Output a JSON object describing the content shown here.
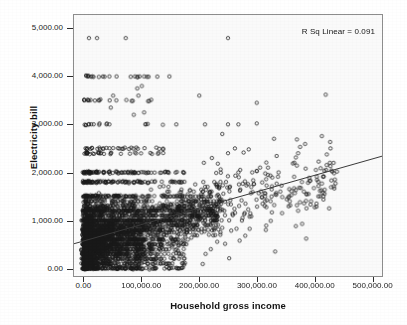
{
  "chart_data": {
    "type": "scatter",
    "title": "",
    "xlabel": "Household gross income",
    "ylabel": "Electricity bill",
    "xlim": [
      -18000,
      518000
    ],
    "ylim": [
      -160,
      5280
    ],
    "grid": false,
    "legend": null,
    "annotations": [
      {
        "name": "r-squared",
        "text": "R Sq Linear = 0.091",
        "position": "top-right"
      }
    ],
    "xticks": [
      {
        "value": 0,
        "label": "0.00"
      },
      {
        "value": 100000,
        "label": "100,000.00"
      },
      {
        "value": 200000,
        "label": "200,000.00"
      },
      {
        "value": 300000,
        "label": "300,000.00"
      },
      {
        "value": 400000,
        "label": "400,000.00"
      },
      {
        "value": 500000,
        "label": "500,000.00"
      }
    ],
    "yticks": [
      {
        "value": 0,
        "label": "0.00"
      },
      {
        "value": 1000,
        "label": "1,000.00"
      },
      {
        "value": 2000,
        "label": "2,000.00"
      },
      {
        "value": 3000,
        "label": "3,000.00"
      },
      {
        "value": 4000,
        "label": "4,000.00"
      },
      {
        "value": 5000,
        "label": "5,000.00"
      }
    ],
    "marker": {
      "shape": "open-circle",
      "size_px": 3.4,
      "edge_color": "#1a1a1a",
      "fill_color": "none"
    },
    "fit_line": {
      "name": "linear-regression-line",
      "color": "#3a3a3a",
      "width_px": 1,
      "r_squared": 0.091,
      "intercept": 610,
      "slope": 0.0034,
      "endpoints": [
        {
          "x": -18000,
          "y": 549
        },
        {
          "x": 518000,
          "y": 2371
        }
      ]
    },
    "series": [
      {
        "name": "households",
        "n_points_drawn": 2400,
        "description": "Dense cloud concentrated below 150,000 income and below 2,000 bill, with horizontal banding at round bill values (0, 500, 1000, 1200, 1500, 1800, 2000, 2400, 2500, 3000, 3500, 4000) and a long sparse right tail out to 430,000 income.",
        "notable_points": [
          {
            "x": 8000,
            "y": 4800
          },
          {
            "x": 22000,
            "y": 4800
          },
          {
            "x": 72000,
            "y": 4800
          },
          {
            "x": 250000,
            "y": 4800
          },
          {
            "x": 6000,
            "y": 4000
          },
          {
            "x": 14000,
            "y": 4000
          },
          {
            "x": 56000,
            "y": 4000
          },
          {
            "x": 88000,
            "y": 4000
          },
          {
            "x": 96000,
            "y": 4000
          },
          {
            "x": 104000,
            "y": 4000
          },
          {
            "x": 148000,
            "y": 4000
          },
          {
            "x": 100000,
            "y": 3800
          },
          {
            "x": 92000,
            "y": 3750
          },
          {
            "x": 50000,
            "y": 3600
          },
          {
            "x": 94000,
            "y": 3600
          },
          {
            "x": 200000,
            "y": 3600
          },
          {
            "x": 420000,
            "y": 3620
          },
          {
            "x": 8000,
            "y": 3500
          },
          {
            "x": 26000,
            "y": 3500
          },
          {
            "x": 44000,
            "y": 3500
          },
          {
            "x": 300000,
            "y": 3450
          },
          {
            "x": 46000,
            "y": 3350
          },
          {
            "x": 104000,
            "y": 3250
          },
          {
            "x": 86000,
            "y": 3200
          },
          {
            "x": 160000,
            "y": 3000
          },
          {
            "x": 210000,
            "y": 3000
          },
          {
            "x": 250000,
            "y": 3000
          },
          {
            "x": 268000,
            "y": 3000
          },
          {
            "x": 300000,
            "y": 3020
          },
          {
            "x": 240000,
            "y": 2800
          },
          {
            "x": 330000,
            "y": 2700
          },
          {
            "x": 262000,
            "y": 2500
          },
          {
            "x": 286000,
            "y": 2480
          },
          {
            "x": 372000,
            "y": 2400
          },
          {
            "x": 250000,
            "y": 2400
          },
          {
            "x": 222000,
            "y": 2300
          },
          {
            "x": 208000,
            "y": 2200
          },
          {
            "x": 338000,
            "y": 2000
          },
          {
            "x": 268000,
            "y": 2000
          },
          {
            "x": 292000,
            "y": 2000
          },
          {
            "x": 382000,
            "y": 1600
          },
          {
            "x": 416000,
            "y": 1500
          },
          {
            "x": 404000,
            "y": 1350
          },
          {
            "x": 426000,
            "y": 1250
          },
          {
            "x": 372000,
            "y": 1200
          },
          {
            "x": 344000,
            "y": 1150
          },
          {
            "x": 368000,
            "y": 880
          },
          {
            "x": 386000,
            "y": 620
          },
          {
            "x": 332000,
            "y": 350
          },
          {
            "x": 252000,
            "y": 210
          },
          {
            "x": 206000,
            "y": 90
          }
        ]
      }
    ]
  },
  "axes": {
    "y_title": "Electricity bill",
    "x_title": "Household gross income"
  },
  "annotation": {
    "r_squared_text": "R Sq Linear = 0.091"
  },
  "colors": {
    "plot_background": "#fafafa",
    "page_background": "#ffffff",
    "frame": "#8d8d8d",
    "marker": "#1a1a1a",
    "fit_line": "#3a3a3a",
    "text": "#1a1a1a"
  }
}
